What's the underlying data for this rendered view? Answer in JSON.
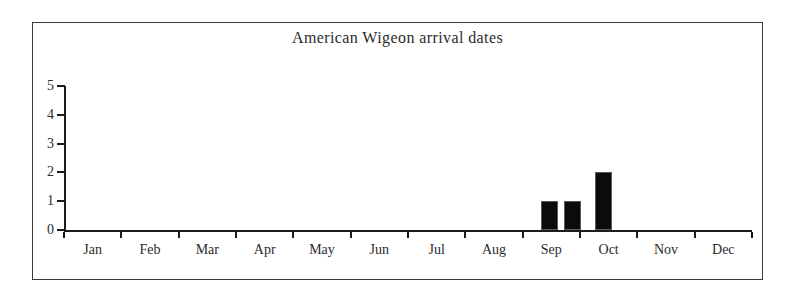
{
  "chart_data": {
    "type": "bar",
    "title": "American Wigeon arrival dates",
    "xlabel": "",
    "ylabel": "",
    "ylim": [
      0,
      5
    ],
    "ytick_values": [
      0,
      1,
      2,
      3,
      4,
      5
    ],
    "ytick_labels": [
      "0",
      "1",
      "2",
      "3",
      "4",
      "5"
    ],
    "grid": false,
    "legend": false,
    "categories": [
      "Jan",
      "Feb",
      "Mar",
      "Apr",
      "May",
      "Jun",
      "Jul",
      "Aug",
      "Sep",
      "Oct",
      "Nov",
      "Dec"
    ],
    "bin_note": "half-month bins",
    "bars": [
      {
        "bin": "Sep early",
        "month": "Sep",
        "half": 1,
        "value": 0
      },
      {
        "bin": "Sep late",
        "month": "Sep",
        "half": 2,
        "value": 0
      },
      {
        "bin": "Oct early",
        "month": "Oct",
        "half": 1,
        "value": 0
      }
    ],
    "values_by_month": {
      "Jan": 0,
      "Feb": 0,
      "Mar": 0,
      "Apr": 0,
      "May": 0,
      "Jun": 0,
      "Jul": 0,
      "Aug": 0,
      "Sep": 2,
      "Oct": 2,
      "Nov": 0,
      "Dec": 0
    },
    "plotted_bars": [
      {
        "label": "bar-1",
        "value": 1,
        "x_start_frac": 0.693,
        "x_width_frac": 0.0247
      },
      {
        "label": "bar-2",
        "value": 1,
        "x_start_frac": 0.7267,
        "x_width_frac": 0.0247
      },
      {
        "label": "bar-3",
        "value": 2,
        "x_start_frac": 0.7718,
        "x_width_frac": 0.0247
      }
    ]
  },
  "colors": {
    "bar_fill": "#0b0b0b",
    "axis": "#1c1c1c",
    "frame": "#3a3a3a",
    "text": "#2b2b2b",
    "background": "#ffffff"
  }
}
